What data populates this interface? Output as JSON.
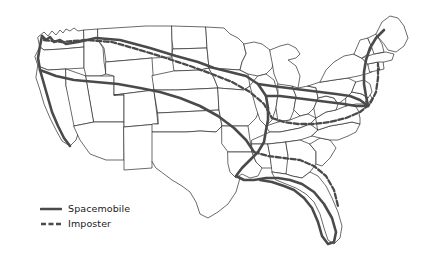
{
  "map": {
    "title": "United States route map",
    "background_color": "#ffffff",
    "state_border_color": "#2b2b2b",
    "route_color": "#4a4a4a"
  },
  "legend": {
    "items": [
      {
        "label": "Spacemobile",
        "style": "solid",
        "color": "#4a4a4a",
        "icon": "solid-line-swatch"
      },
      {
        "label": "Imposter",
        "style": "dashed",
        "color": "#4a4a4a",
        "icon": "dashed-line-swatch"
      }
    ]
  },
  "routes": [
    {
      "name": "Spacemobile",
      "style": "solid"
    },
    {
      "name": "Imposter",
      "style": "dashed"
    }
  ]
}
